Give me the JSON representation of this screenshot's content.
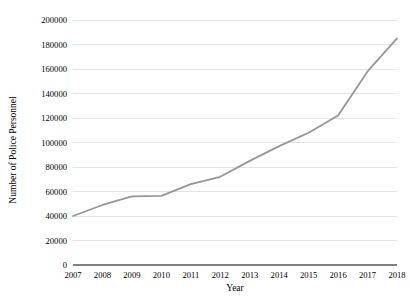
{
  "chart_data": {
    "type": "line",
    "title": "",
    "xlabel": "Year",
    "ylabel": "Number of Police Personnel",
    "categories": [
      "2007",
      "2008",
      "2009",
      "2010",
      "2011",
      "2012",
      "2013",
      "2014",
      "2015",
      "2016",
      "2017",
      "2018"
    ],
    "x": [
      2007,
      2008,
      2009,
      2010,
      2011,
      2012,
      2013,
      2014,
      2015,
      2016,
      2017,
      2018
    ],
    "values": [
      40000,
      49000,
      56000,
      56500,
      66000,
      72000,
      85000,
      97000,
      108000,
      122000,
      158000,
      185000
    ],
    "series": [
      {
        "name": "Number of Police Personnel",
        "values": [
          40000,
          49000,
          56000,
          56500,
          66000,
          72000,
          85000,
          97000,
          108000,
          122000,
          158000,
          185000
        ],
        "color": "#969696"
      }
    ],
    "ylim": [
      0,
      200000
    ],
    "ytick_values": [
      0,
      20000,
      40000,
      60000,
      80000,
      100000,
      120000,
      140000,
      160000,
      180000,
      200000
    ],
    "ytick_labels": [
      "0",
      "20000",
      "40000",
      "60000",
      "80000",
      "100000",
      "120000",
      "140000",
      "160000",
      "180000",
      "200000"
    ],
    "xtick_labels": [
      "2007",
      "2008",
      "2009",
      "2010",
      "2011",
      "2012",
      "2013",
      "2014",
      "2015",
      "2016",
      "2017",
      "2018"
    ],
    "grid": true,
    "grid_axis": "y",
    "grid_color": "#d9d9d9",
    "axis_color": "#808080",
    "legend": false,
    "legend_position": "none"
  },
  "labels": {
    "y_axis_title": "Number of Police Personnel",
    "x_axis_title": "Year"
  }
}
